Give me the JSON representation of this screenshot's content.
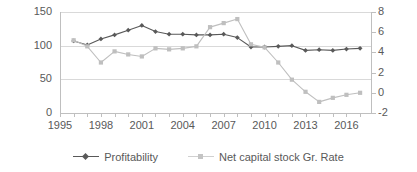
{
  "chart_data": {
    "type": "line",
    "title": "",
    "xlabel": "",
    "ylabel": "",
    "x": [
      1996,
      1997,
      1998,
      1999,
      2000,
      2001,
      2002,
      2003,
      2004,
      2005,
      2006,
      2007,
      2008,
      2009,
      2010,
      2011,
      2012,
      2013,
      2014,
      2015,
      2016,
      2017
    ],
    "xticklabels": [
      "1995",
      "1998",
      "2001",
      "2004",
      "2007",
      "2010",
      "2013",
      "2016"
    ],
    "xtickyears": [
      1995,
      1998,
      2001,
      2004,
      2007,
      2010,
      2013,
      2016
    ],
    "xlim": [
      1995,
      2017.8
    ],
    "grid": "horizontal",
    "legend_position": "bottom",
    "axes": [
      {
        "id": "left",
        "ylim": [
          0,
          150
        ],
        "yticks": [
          0,
          50,
          100,
          150
        ],
        "yticklabels": [
          "0",
          "50",
          "100",
          "150"
        ]
      },
      {
        "id": "right",
        "ylim": [
          -2,
          8
        ],
        "yticks": [
          -2,
          0,
          2,
          4,
          6,
          8
        ],
        "yticklabels": [
          "-2",
          "0",
          "2",
          "4",
          "6",
          "8"
        ]
      }
    ],
    "series": [
      {
        "name": "Profitability",
        "axis": "left",
        "color": "#595959",
        "marker": "diamond",
        "values": [
          107,
          101,
          110,
          116,
          123,
          130,
          121,
          117,
          117,
          116,
          116,
          117,
          112,
          98,
          98,
          99,
          100,
          93,
          94,
          93,
          95,
          96
        ]
      },
      {
        "name": "Net capital stock Gr. Rate",
        "axis": "right",
        "color": "#bfbfbf",
        "marker": "square",
        "values": [
          5.2,
          4.6,
          3.0,
          4.1,
          3.8,
          3.6,
          4.4,
          4.3,
          4.4,
          4.6,
          6.5,
          6.9,
          7.3,
          4.8,
          4.5,
          3.0,
          1.3,
          0.1,
          -0.9,
          -0.5,
          -0.2,
          0.0
        ]
      }
    ]
  },
  "legend": {
    "items": [
      {
        "label": "Profitability",
        "marker": "diamond-marker",
        "color": "#595959"
      },
      {
        "label": "Net capital stock Gr. Rate",
        "marker": "square-marker",
        "color": "#bfbfbf"
      }
    ]
  }
}
